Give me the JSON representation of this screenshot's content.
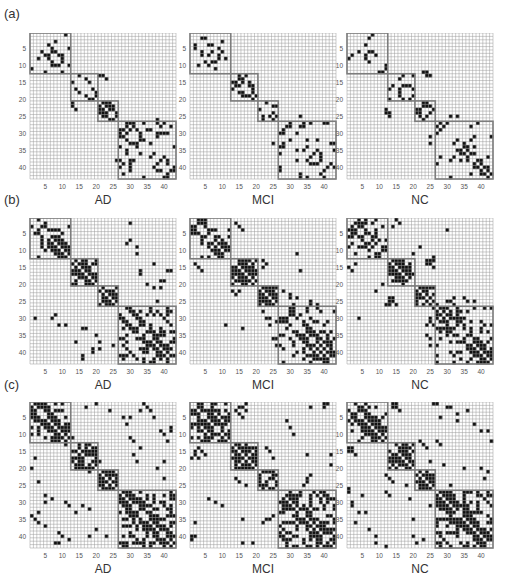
{
  "figure": {
    "rows": [
      {
        "label": "(a)"
      },
      {
        "label": "(b)"
      },
      {
        "label": "(c)"
      }
    ],
    "groups": [
      "AD",
      "MCI",
      "NC"
    ],
    "ticks": [
      5,
      10,
      15,
      20,
      25,
      30,
      35,
      40
    ],
    "n": 43,
    "modules": [
      [
        1,
        12
      ],
      [
        13,
        20
      ],
      [
        21,
        26
      ],
      [
        27,
        43
      ]
    ],
    "colors": {
      "grid": "#9a9a9a",
      "filled": "#111111",
      "module_box": "#7d7d7d",
      "background": "#ffffff"
    }
  },
  "chart_data": {
    "type": "heatmap",
    "title": "",
    "xlabel_per_panel": [
      "AD",
      "MCI",
      "NC"
    ],
    "x_ticks": [
      5,
      10,
      15,
      20,
      25,
      30,
      35,
      40
    ],
    "y_ticks": [
      5,
      10,
      15,
      20,
      25,
      30,
      35,
      40
    ],
    "axis_range": [
      1,
      43
    ],
    "modules": [
      [
        1,
        12
      ],
      [
        13,
        20
      ],
      [
        21,
        26
      ],
      [
        27,
        43
      ]
    ],
    "panels": [
      {
        "row": "(a)",
        "group": "AD",
        "density": 0.06,
        "extra": [
          [
            26,
            38
          ],
          [
            38,
            26
          ],
          [
            21,
            13
          ],
          [
            22,
            13
          ],
          [
            23,
            14
          ]
        ]
      },
      {
        "row": "(a)",
        "group": "MCI",
        "density": 0.05,
        "extra": [
          [
            33,
            25
          ],
          [
            30,
            28
          ]
        ]
      },
      {
        "row": "(a)",
        "group": "NC",
        "density": 0.05,
        "extra": [
          [
            12,
            23
          ],
          [
            13,
            24
          ],
          [
            24,
            12
          ],
          [
            25,
            13
          ],
          [
            31,
            25
          ],
          [
            33,
            25
          ]
        ]
      },
      {
        "row": "(b)",
        "group": "AD",
        "density": 0.12,
        "extra": [
          [
            8,
            29
          ],
          [
            9,
            32
          ],
          [
            16,
            33
          ],
          [
            17,
            33
          ],
          [
            25,
            38
          ],
          [
            27,
            41
          ],
          [
            33,
            39
          ],
          [
            34,
            40
          ],
          [
            35,
            20
          ],
          [
            37,
            21
          ],
          [
            40,
            19
          ],
          [
            42,
            16
          ],
          [
            7,
            30
          ],
          [
            16,
            41
          ],
          [
            14,
            37
          ],
          [
            23,
            22
          ]
        ]
      },
      {
        "row": "(b)",
        "group": "MCI",
        "density": 0.12,
        "extra": [
          [
            2,
            14
          ],
          [
            3,
            15
          ],
          [
            4,
            16
          ],
          [
            14,
            2
          ],
          [
            15,
            3
          ],
          [
            16,
            4
          ],
          [
            13,
            22
          ],
          [
            14,
            23
          ],
          [
            15,
            22
          ],
          [
            22,
            28
          ],
          [
            23,
            30
          ],
          [
            24,
            32
          ],
          [
            26,
            36
          ],
          [
            30,
            24
          ],
          [
            31,
            26
          ],
          [
            36,
            25
          ],
          [
            38,
            26
          ],
          [
            33,
            16
          ]
        ]
      },
      {
        "row": "(b)",
        "group": "NC",
        "density": 0.12,
        "extra": [
          [
            1,
            15
          ],
          [
            2,
            16
          ],
          [
            3,
            14
          ],
          [
            14,
            24
          ],
          [
            14,
            25
          ],
          [
            15,
            26
          ],
          [
            24,
            13
          ],
          [
            25,
            13
          ],
          [
            26,
            12
          ],
          [
            27,
            26
          ],
          [
            25,
            30
          ],
          [
            26,
            32
          ],
          [
            30,
            4
          ],
          [
            31,
            25
          ],
          [
            32,
            24
          ],
          [
            35,
            24
          ],
          [
            36,
            25
          ],
          [
            25,
            38
          ]
        ]
      },
      {
        "row": "(c)",
        "group": "AD",
        "density": 0.16,
        "extra": [
          [
            1,
            20
          ],
          [
            3,
            36
          ],
          [
            5,
            30
          ],
          [
            5,
            37
          ],
          [
            8,
            42
          ],
          [
            12,
            31
          ],
          [
            14,
            33
          ],
          [
            17,
            2
          ],
          [
            18,
            21
          ],
          [
            20,
            1
          ],
          [
            28,
            5
          ],
          [
            29,
            7
          ],
          [
            30,
            11
          ],
          [
            31,
            16
          ],
          [
            32,
            18
          ],
          [
            33,
            3
          ],
          [
            34,
            1
          ],
          [
            35,
            2
          ],
          [
            38,
            20
          ],
          [
            40,
            10
          ],
          [
            41,
            12
          ],
          [
            42,
            9
          ],
          [
            23,
            40
          ],
          [
            28,
            43
          ]
        ]
      },
      {
        "row": "(c)",
        "group": "MCI",
        "density": 0.16,
        "extra": [
          [
            2,
            16
          ],
          [
            3,
            17
          ],
          [
            4,
            15
          ],
          [
            1,
            40
          ],
          [
            14,
            3
          ],
          [
            15,
            2
          ],
          [
            16,
            5
          ],
          [
            17,
            1
          ],
          [
            14,
            23
          ],
          [
            15,
            24
          ],
          [
            17,
            25
          ],
          [
            22,
            36
          ],
          [
            24,
            35
          ],
          [
            25,
            34
          ],
          [
            29,
            6
          ],
          [
            30,
            8
          ],
          [
            31,
            10
          ],
          [
            33,
            27
          ],
          [
            35,
            23
          ],
          [
            36,
            22
          ],
          [
            40,
            2
          ],
          [
            41,
            1
          ],
          [
            42,
            16
          ],
          [
            27,
            40
          ]
        ]
      },
      {
        "row": "(c)",
        "group": "NC",
        "density": 0.16,
        "extra": [
          [
            1,
            14
          ],
          [
            2,
            15
          ],
          [
            3,
            16
          ],
          [
            2,
            30
          ],
          [
            4,
            33
          ],
          [
            7,
            38
          ],
          [
            9,
            40
          ],
          [
            14,
            2
          ],
          [
            15,
            1
          ],
          [
            16,
            3
          ],
          [
            18,
            25
          ],
          [
            20,
            35
          ],
          [
            22,
            12
          ],
          [
            23,
            13
          ],
          [
            24,
            14
          ],
          [
            27,
            1
          ],
          [
            28,
            5
          ],
          [
            31,
            2
          ],
          [
            33,
            6
          ],
          [
            36,
            3
          ],
          [
            40,
            20
          ],
          [
            41,
            23
          ],
          [
            42,
            9
          ],
          [
            43,
            12
          ]
        ]
      }
    ]
  }
}
